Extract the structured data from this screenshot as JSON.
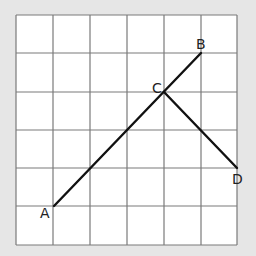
{
  "diagram": {
    "background": "#e6e6e6",
    "grid": {
      "cols": 6,
      "rows": 6,
      "x0": 16,
      "y0": 15,
      "x1": 237,
      "y1": 245,
      "line_color": "#7a7a7a",
      "fill": "#ffffff"
    },
    "points": {
      "A": {
        "label": "A",
        "col": 1,
        "row": 5
      },
      "B": {
        "label": "B",
        "col": 5,
        "row": 1
      },
      "C": {
        "label": "C",
        "col": 4,
        "row": 2
      },
      "D": {
        "label": "D",
        "col": 6,
        "row": 4
      }
    },
    "segments": [
      {
        "from": "A",
        "to": "B"
      },
      {
        "from": "C",
        "to": "D"
      }
    ],
    "segment_color": "#111111"
  }
}
